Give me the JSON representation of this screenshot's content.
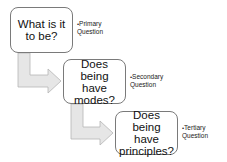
{
  "diagram": {
    "steps": [
      {
        "question": "What is it to be?",
        "label_bullet": "•",
        "label": "Primary Question"
      },
      {
        "question": "Does being have modes?",
        "label_bullet": "•",
        "label": "Secondary Question"
      },
      {
        "question": "Does being have principles?",
        "label_bullet": "•",
        "label": "Tertiary Question"
      }
    ],
    "colors": {
      "box_border": "#7a7a7a",
      "arrow_fill": "#e6e6e6",
      "arrow_stroke": "#b5b5b5",
      "text": "#111111"
    }
  }
}
